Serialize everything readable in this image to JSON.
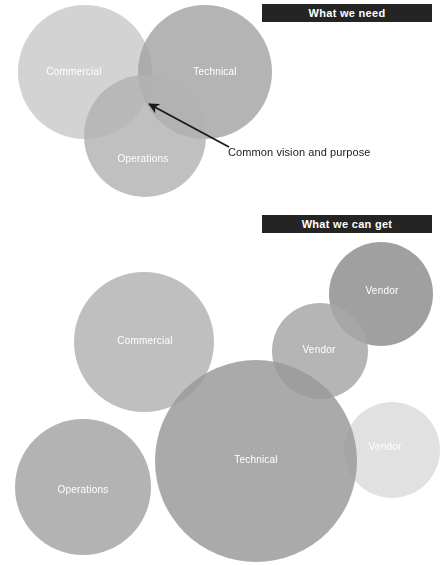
{
  "sections": {
    "need": {
      "banner_label": "What we need",
      "annotation": {
        "text": "Common vision and purpose",
        "arrow_from_x": 229,
        "arrow_from_y": 147,
        "arrow_to_x": 147,
        "arrow_to_y": 103
      },
      "circles": [
        {
          "label": "Commercial",
          "cx": 85,
          "cy": 72,
          "r": 67,
          "color": "#c9c9c9",
          "label_x": 74,
          "label_y": 71
        },
        {
          "label": "Technical",
          "cx": 205,
          "cy": 72,
          "r": 67,
          "color": "#a3a3a3",
          "label_x": 215,
          "label_y": 71
        },
        {
          "label": "Operations",
          "cx": 145,
          "cy": 136,
          "r": 61,
          "color": "#b2b2b2",
          "label_x": 143,
          "label_y": 158
        }
      ]
    },
    "get": {
      "banner_label": "What we can get",
      "circles": [
        {
          "label": "Commercial",
          "cx": 144,
          "cy": 342,
          "r": 70,
          "color": "#b4b4b4",
          "label_x": 145,
          "label_y": 340
        },
        {
          "label": "Vendor",
          "cx": 381,
          "cy": 294,
          "r": 52,
          "color": "#8f8f8f",
          "label_x": 382,
          "label_y": 290
        },
        {
          "label": "Vendor",
          "cx": 320,
          "cy": 351,
          "r": 48,
          "color": "#a8a8a8",
          "label_x": 319,
          "label_y": 349
        },
        {
          "label": "Vendor",
          "cx": 392,
          "cy": 450,
          "r": 48,
          "color": "#dcdcdc",
          "label_x": 385,
          "label_y": 446
        },
        {
          "label": "Technical",
          "cx": 256,
          "cy": 461,
          "r": 101,
          "color": "#9b9b9b",
          "label_x": 256,
          "label_y": 459
        },
        {
          "label": "Operations",
          "cx": 83,
          "cy": 487,
          "r": 68,
          "color": "#a6a6a6",
          "label_x": 83,
          "label_y": 489
        }
      ]
    }
  },
  "colors": {
    "banner_background": "#242424",
    "banner_text": "#ffffff",
    "arrow": "#1a1a1a",
    "page_background": "#ffffff"
  }
}
